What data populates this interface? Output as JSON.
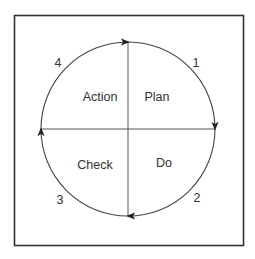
{
  "diagram": {
    "type": "PDCA cycle",
    "quadrants": [
      {
        "id": "plan",
        "label": "Plan",
        "position": "top-right",
        "step": "1"
      },
      {
        "id": "do",
        "label": "Do",
        "position": "bottom-right",
        "step": "2"
      },
      {
        "id": "check",
        "label": "Check",
        "position": "bottom-left",
        "step": "3"
      },
      {
        "id": "action",
        "label": "Action",
        "position": "top-left",
        "step": "4"
      }
    ],
    "direction": "clockwise",
    "colors": {
      "frame": "#333333",
      "lines": "#555555",
      "text": "#333333",
      "background": "#ffffff"
    }
  }
}
